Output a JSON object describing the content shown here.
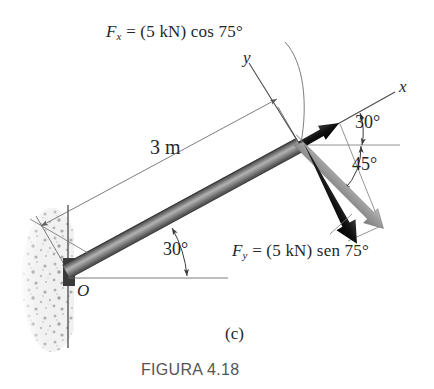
{
  "figure": {
    "part_label": "(c)",
    "caption": "FIGURA 4.18",
    "background_color": "#ffffff"
  },
  "labels": {
    "fx_prefix": "F",
    "fx_sub": "x",
    "fx_expr": " = (5 kN) cos 75°",
    "fy_prefix": "F",
    "fy_sub": "y",
    "fy_expr": " = (5 kN) sen 75°",
    "length_dim": "3 m",
    "origin": "O",
    "axis_x": "x",
    "axis_y": "y",
    "angle_beam": "30°",
    "angle_x_axis": "30°",
    "angle_resultant": "45°"
  },
  "colors": {
    "ink": "#262626",
    "thin_line": "#6e6e6e",
    "beam_dark": "#4a4a4a",
    "beam_light": "#a8a8a8",
    "vector_black": "#111111",
    "vector_gray": "#8c8c8c",
    "wall_speckle": "#b9b9b9",
    "caption": "#555555"
  },
  "geometry": {
    "origin_point": [
      68,
      271
    ],
    "tip_point": [
      300,
      145
    ],
    "beam_angle_deg": 30,
    "x_axis_angle_deg": 30,
    "resultant_angle_deg": 45,
    "force_magnitude_kn": 5,
    "force_angle_deg": 75,
    "beam_length_m": 3
  }
}
